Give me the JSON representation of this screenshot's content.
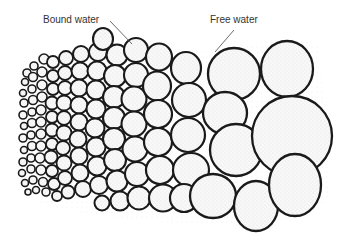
{
  "figure": {
    "labels": {
      "bound_water": "Bound water",
      "free_water": "Free water"
    },
    "colors": {
      "particle_stroke": "#1a1a1a",
      "particle_fill": "#f7f7f7",
      "stipple": "#9a9a9a",
      "label_text": "#333333",
      "leader_line": "#444444"
    }
  }
}
